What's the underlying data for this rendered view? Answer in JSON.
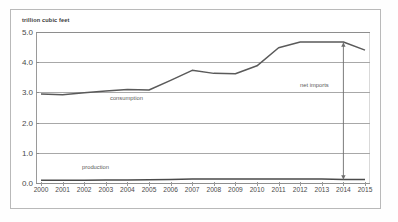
{
  "figure": {
    "axis_title": "trillion cubic feet",
    "background": "#ffffff",
    "frame_color": "#b9b9b9"
  },
  "annotations": {
    "consumption_label": "consumption",
    "production_label": "production",
    "net_imports_label": "net imports",
    "arrow_year": "2014",
    "arrow_top_value": "4.65",
    "arrow_bottom_value": "0.12"
  },
  "chart_data": {
    "type": "line",
    "title": "",
    "subtitle": "",
    "xlabel": "",
    "ylabel": "trillion cubic feet",
    "ylim": [
      0.0,
      5.0
    ],
    "xlim": [
      "2000",
      "2015"
    ],
    "grid": true,
    "legend": "inline-labels",
    "yticks": [
      "5.0",
      "4.0",
      "3.0",
      "2.0",
      "1.0",
      "0.0"
    ],
    "ytick_values": [
      5.0,
      4.0,
      3.0,
      2.0,
      1.0,
      0.0
    ],
    "categories": [
      "2000",
      "2001",
      "2002",
      "2003",
      "2004",
      "2005",
      "2006",
      "2007",
      "2008",
      "2009",
      "2010",
      "2011",
      "2012",
      "2013",
      "2014",
      "2015"
    ],
    "x": [
      2000,
      2001,
      2002,
      2003,
      2004,
      2005,
      2006,
      2007,
      2008,
      2009,
      2010,
      2011,
      2012,
      2013,
      2014,
      2015
    ],
    "series": [
      {
        "name": "consumption",
        "color": "#5a5a5a",
        "values": [
          2.95,
          2.92,
          2.99,
          3.05,
          3.1,
          3.08,
          3.4,
          3.73,
          3.63,
          3.62,
          3.88,
          4.48,
          4.67,
          4.67,
          4.67,
          4.4
        ]
      },
      {
        "name": "production",
        "color": "#4a4a4a",
        "values": [
          0.09,
          0.09,
          0.09,
          0.1,
          0.1,
          0.11,
          0.12,
          0.13,
          0.13,
          0.13,
          0.13,
          0.13,
          0.13,
          0.13,
          0.12,
          0.12
        ]
      }
    ]
  }
}
